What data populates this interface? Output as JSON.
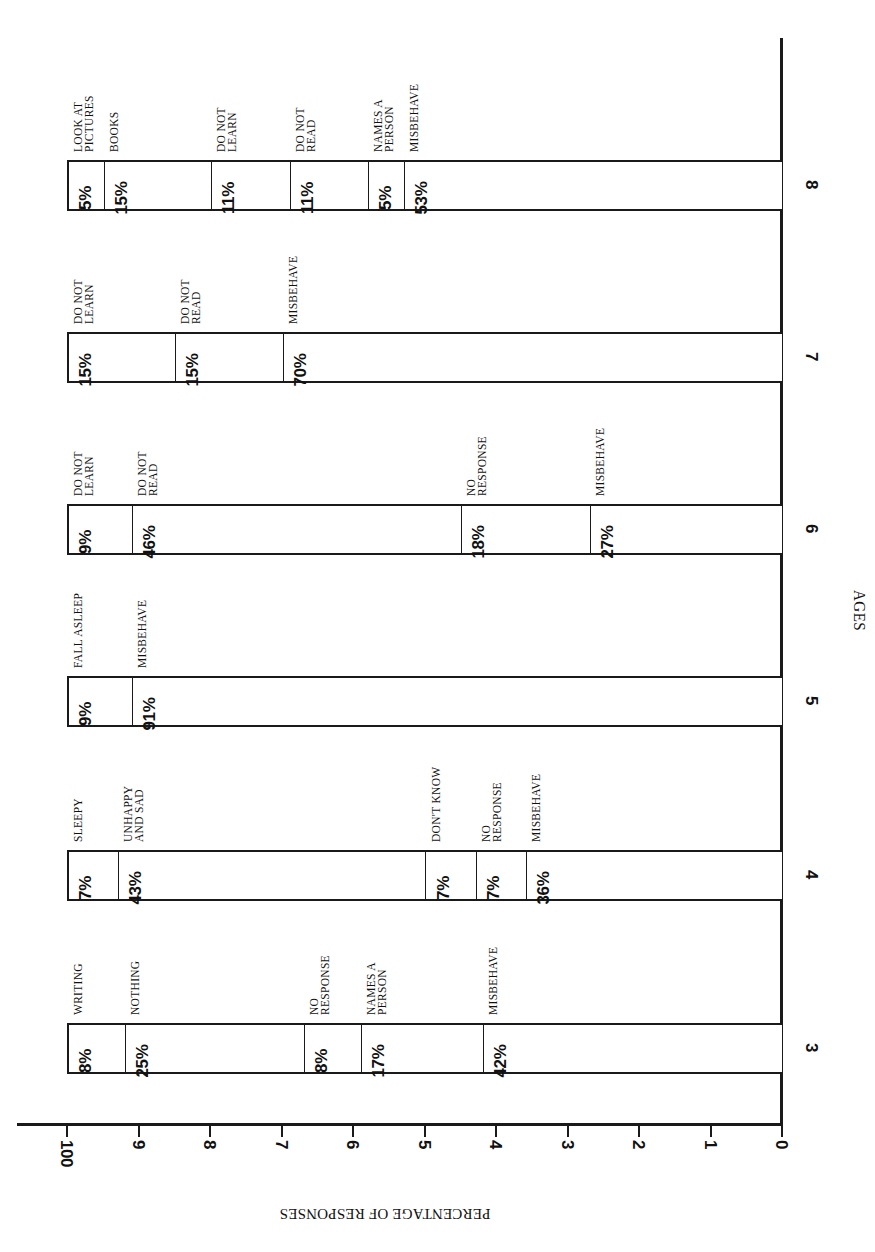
{
  "chart_data": {
    "type": "bar",
    "subtype": "stacked-100-percent",
    "orientation": "rotated 90 degrees (bars run horizontally on page; read with page turned)",
    "title": "",
    "xlabel": "AGES",
    "ylabel": "PERCENTAGE OF RESPONSES",
    "ylim": [
      0,
      100
    ],
    "ytick_labels": [
      "0",
      "1",
      "2",
      "3",
      "4",
      "5",
      "6",
      "7",
      "8",
      "9",
      "100"
    ],
    "grid": false,
    "legend": "none (segment labels printed beside each bar)",
    "categories": [
      "3",
      "4",
      "5",
      "6",
      "7",
      "8"
    ],
    "bars": [
      {
        "age": "3",
        "segments": [
          {
            "label": "WRITING",
            "value": 8,
            "text": "8%"
          },
          {
            "label": "NOTHING",
            "value": 25,
            "text": "25%"
          },
          {
            "label": "NO\nRESPONSE",
            "value": 8,
            "text": "8%"
          },
          {
            "label": "NAMES A\nPERSON",
            "value": 17,
            "text": "17%"
          },
          {
            "label": "MISBEHAVE",
            "value": 42,
            "text": "42%"
          }
        ]
      },
      {
        "age": "4",
        "segments": [
          {
            "label": "SLEEPY",
            "value": 7,
            "text": "7%"
          },
          {
            "label": "UNHAPPY\nAND SAD",
            "value": 43,
            "text": "43%"
          },
          {
            "label": "DON'T KNOW",
            "value": 7,
            "text": "7%"
          },
          {
            "label": "NO\nRESPONSE",
            "value": 7,
            "text": "7%"
          },
          {
            "label": "MISBEHAVE",
            "value": 36,
            "text": "36%"
          }
        ]
      },
      {
        "age": "5",
        "segments": [
          {
            "label": "FALL ASLEEP",
            "value": 9,
            "text": "9%"
          },
          {
            "label": "MISBEHAVE",
            "value": 91,
            "text": "91%"
          }
        ]
      },
      {
        "age": "6",
        "segments": [
          {
            "label": "DO NOT\nLEARN",
            "value": 9,
            "text": "9%"
          },
          {
            "label": "DO NOT\nREAD",
            "value": 46,
            "text": "46%"
          },
          {
            "label": "NO\nRESPONSE",
            "value": 18,
            "text": "18%"
          },
          {
            "label": "MISBEHAVE",
            "value": 27,
            "text": "27%"
          }
        ]
      },
      {
        "age": "7",
        "segments": [
          {
            "label": "DO NOT\nLEARN",
            "value": 15,
            "text": "15%"
          },
          {
            "label": "DO NOT\nREAD",
            "value": 15,
            "text": "15%"
          },
          {
            "label": "MISBEHAVE",
            "value": 70,
            "text": "70%"
          }
        ]
      },
      {
        "age": "8",
        "segments": [
          {
            "label": "LOOK AT\nPICTURES",
            "value": 5,
            "text": "5%"
          },
          {
            "label": "BOOKS",
            "value": 15,
            "text": "15%"
          },
          {
            "label": "DO NOT\nLEARN",
            "value": 11,
            "text": "11%"
          },
          {
            "label": "DO NOT\nREAD",
            "value": 11,
            "text": "11%"
          },
          {
            "label": "NAMES A\nPERSON",
            "value": 5,
            "text": "5%"
          },
          {
            "label": "MISBEHAVE",
            "value": 53,
            "text": "53%"
          }
        ]
      }
    ]
  },
  "layout": {
    "bar_top_px": {
      "3": 1023,
      "4": 850,
      "5": 676,
      "6": 504,
      "7": 332,
      "8": 160
    },
    "bar_thickness_px": 51,
    "zero_x_px": 782,
    "hundred_x_px": 67
  }
}
